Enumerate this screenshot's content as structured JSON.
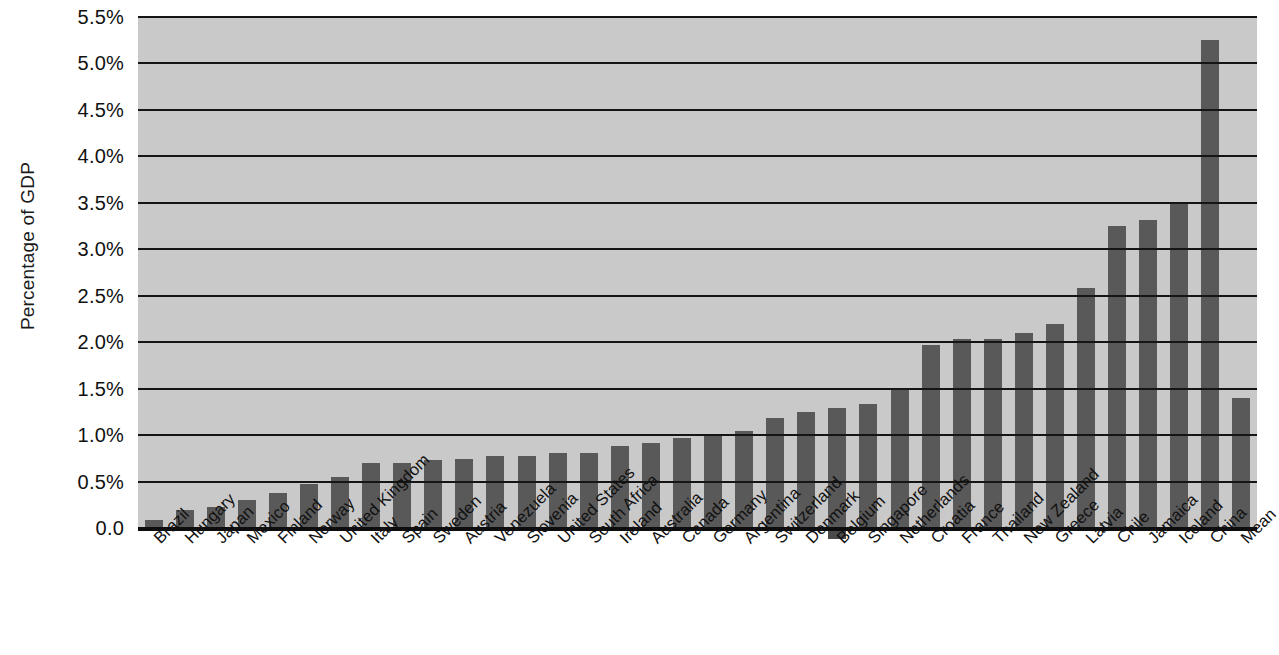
{
  "chart_data": {
    "type": "bar",
    "title": "",
    "xlabel": "",
    "ylabel": "Percentage of GDP",
    "ylim": [
      0,
      5.5
    ],
    "ytick_labels": [
      "0.0",
      "0.5%",
      "1.0%",
      "1.5%",
      "2.0%",
      "2.5%",
      "3.0%",
      "3.5%",
      "4.0%",
      "4.5%",
      "5.0%",
      "5.5%"
    ],
    "ytick_values": [
      0,
      0.5,
      1.0,
      1.5,
      2.0,
      2.5,
      3.0,
      3.5,
      4.0,
      4.5,
      5.0,
      5.5
    ],
    "grid": true,
    "legend": false,
    "categories": [
      "Brazil",
      "Hungary",
      "Japan",
      "Mexico",
      "Finland",
      "Norway",
      "United Kingdom",
      "Italy",
      "Spain",
      "Sweden",
      "Austria",
      "Venezuela",
      "Slovenia",
      "United States",
      "South Africa",
      "Ireland",
      "Australia",
      "Canada",
      "Germany",
      "Argentina",
      "Switzerland",
      "Denmark",
      "Belgium",
      "Singapore",
      "Netherlands",
      "Croatia",
      "France",
      "Thailand",
      "New Zealand",
      "Greece",
      "Latvia",
      "Chile",
      "Jamaica",
      "Iceland",
      "China",
      "Mean"
    ],
    "values": [
      0.09,
      0.19,
      0.23,
      0.3,
      0.38,
      0.47,
      0.55,
      0.7,
      0.7,
      0.73,
      0.74,
      0.77,
      0.78,
      0.81,
      0.81,
      0.88,
      0.91,
      0.97,
      1.01,
      1.04,
      1.18,
      1.25,
      1.29,
      1.33,
      1.49,
      1.97,
      2.03,
      2.03,
      2.1,
      2.2,
      2.58,
      3.25,
      3.32,
      3.51,
      5.25,
      1.4
    ],
    "series_name": "Percentage of GDP",
    "bar_color": "#595959",
    "plot_background": "#c9c9c9",
    "axis_color": "#111111"
  }
}
